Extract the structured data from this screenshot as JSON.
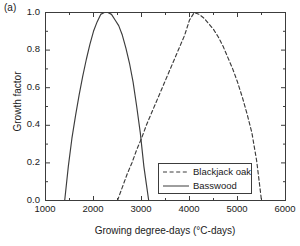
{
  "figure": {
    "panel_label": "(a)",
    "background": "#ffffff",
    "line_color": "#3c3c3c"
  },
  "chart_data": {
    "type": "line",
    "title": "",
    "subtitle": "",
    "panel": "(a)",
    "xlabel": "Growing degree-days (°C-days)",
    "ylabel": "Growth factor",
    "xlim": [
      1000,
      6000
    ],
    "ylim": [
      0.0,
      1.0
    ],
    "xticks": [
      1000,
      2000,
      3000,
      4000,
      5000,
      6000
    ],
    "xtick_labels": [
      "1000",
      "2000",
      "3000",
      "4000",
      "5000",
      "6000"
    ],
    "xminor_interval": 500,
    "yticks": [
      0.0,
      0.2,
      0.4,
      0.6,
      0.8,
      1.0
    ],
    "ytick_labels": [
      "0.0",
      "0.2",
      "0.4",
      "0.6",
      "0.8",
      "1.0"
    ],
    "yminor_interval": 0.1,
    "grid": false,
    "legend_position": "lower right",
    "series": [
      {
        "name": "Blackjack oak",
        "style": "dashed",
        "color": "#3c3c3c",
        "gdd_min": 2500,
        "gdd_max": 5500,
        "gdd_opt": 4000,
        "x": [
          2500,
          2600,
          2700,
          2800,
          2900,
          3000,
          3100,
          3200,
          3300,
          3400,
          3500,
          3600,
          3700,
          3800,
          3900,
          4000,
          4100,
          4200,
          4300,
          4400,
          4500,
          4600,
          4700,
          4800,
          4900,
          5000,
          5100,
          5200,
          5300,
          5400,
          5500
        ],
        "values": [
          0.0,
          0.07,
          0.14,
          0.2,
          0.27,
          0.33,
          0.4,
          0.46,
          0.52,
          0.58,
          0.64,
          0.7,
          0.76,
          0.82,
          0.88,
          0.96,
          1.0,
          0.99,
          0.97,
          0.94,
          0.91,
          0.87,
          0.82,
          0.76,
          0.7,
          0.63,
          0.55,
          0.46,
          0.36,
          0.21,
          0.0
        ]
      },
      {
        "name": "Basswood",
        "style": "solid",
        "color": "#3c3c3c",
        "gdd_min": 1400,
        "gdd_max": 3150,
        "gdd_opt": 2300,
        "x": [
          1400,
          1475,
          1550,
          1625,
          1700,
          1775,
          1850,
          1925,
          2000,
          2075,
          2150,
          2225,
          2300,
          2375,
          2450,
          2525,
          2600,
          2675,
          2750,
          2825,
          2900,
          2975,
          3050,
          3100,
          3150
        ],
        "values": [
          0.0,
          0.18,
          0.33,
          0.45,
          0.56,
          0.66,
          0.75,
          0.83,
          0.9,
          0.95,
          0.99,
          1.0,
          1.0,
          0.99,
          0.96,
          0.93,
          0.88,
          0.81,
          0.73,
          0.63,
          0.5,
          0.36,
          0.18,
          0.09,
          0.0
        ]
      }
    ],
    "annotations": [
      {
        "text": "(a)",
        "position": "top-left-outside"
      }
    ]
  },
  "legend": {
    "items": [
      {
        "label": "Blackjack oak",
        "style": "dashed"
      },
      {
        "label": "Basswood",
        "style": "solid"
      }
    ]
  }
}
